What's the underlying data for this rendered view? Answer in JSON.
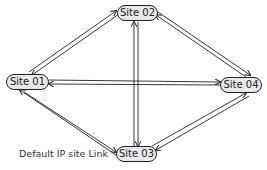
{
  "diagram": {
    "type": "network-topology",
    "nodes": [
      {
        "id": "site01",
        "label": "Site 01"
      },
      {
        "id": "site02",
        "label": "Site 02"
      },
      {
        "id": "site03",
        "label": "Site 03"
      },
      {
        "id": "site04",
        "label": "Site 04"
      }
    ],
    "edges": [
      {
        "from": "site01",
        "to": "site02",
        "bidirectional": true
      },
      {
        "from": "site02",
        "to": "site04",
        "bidirectional": true
      },
      {
        "from": "site01",
        "to": "site04",
        "bidirectional": true
      },
      {
        "from": "site01",
        "to": "site03",
        "bidirectional": true
      },
      {
        "from": "site03",
        "to": "site04",
        "bidirectional": true
      },
      {
        "from": "site02",
        "to": "site03",
        "bidirectional": true
      }
    ],
    "caption": "Default IP site Link",
    "colors": {
      "node_fill": "#e8e8e8",
      "stroke": "#222222"
    }
  }
}
